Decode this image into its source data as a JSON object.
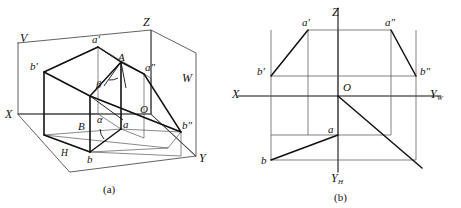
{
  "figure": {
    "ink_color": "#1a1a1a",
    "thin_color": "#3a3a3a",
    "background": "#ffffff"
  },
  "panel_a": {
    "caption": "(a)",
    "description": "Pictorial view of the three mutually perpendicular projection planes V, H, W with spatial segment AB and its three projections",
    "axis_labels": {
      "x": "X",
      "y": "Y",
      "z": "Z",
      "origin": "O"
    },
    "plane_labels": {
      "v": "V",
      "h": "H",
      "w": "W"
    },
    "point_labels": {
      "A": "A",
      "B": "B",
      "a_front": "a′",
      "b_front": "b′",
      "a_top": "a",
      "b_top": "b",
      "a_side": "a″",
      "b_side": "b″"
    },
    "angle_labels": {
      "alpha": "α",
      "beta": "β"
    }
  },
  "panel_b": {
    "caption": "(b)",
    "description": "Unfolded two-dimensional projection drawing with the three views of segment AB",
    "axis_labels": {
      "x": "X",
      "z": "Z",
      "y_w": "Y",
      "y_w_sub": "W",
      "y_h": "Y",
      "y_h_sub": "H",
      "origin": "O"
    },
    "point_labels": {
      "a_front": "a′",
      "b_front": "b′",
      "a_side": "a″",
      "b_side": "b″",
      "a_top": "a",
      "b_top": "b"
    }
  }
}
